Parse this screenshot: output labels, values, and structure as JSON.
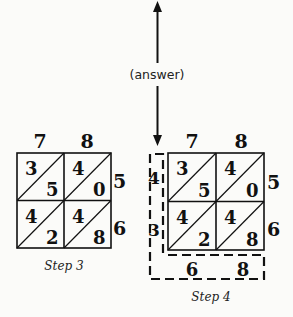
{
  "arrow": {
    "label": "(answer)"
  },
  "step3": {
    "caption": "Step 3",
    "top_digits": [
      "7",
      "8"
    ],
    "right_digits": [
      "5",
      "6"
    ],
    "cells": [
      [
        {
          "tens": "3",
          "ones": "5"
        },
        {
          "tens": "4",
          "ones": "0"
        }
      ],
      [
        {
          "tens": "4",
          "ones": "2"
        },
        {
          "tens": "4",
          "ones": "8"
        }
      ]
    ]
  },
  "step4": {
    "caption": "Step 4",
    "top_digits": [
      "7",
      "8"
    ],
    "right_digits": [
      "5",
      "6"
    ],
    "cells": [
      [
        {
          "tens": "3",
          "ones": "5"
        },
        {
          "tens": "4",
          "ones": "0"
        }
      ],
      [
        {
          "tens": "4",
          "ones": "2"
        },
        {
          "tens": "4",
          "ones": "8"
        }
      ]
    ],
    "left_result_digits": [
      "4",
      "3"
    ],
    "bottom_result_digits": [
      "6",
      "8"
    ]
  }
}
